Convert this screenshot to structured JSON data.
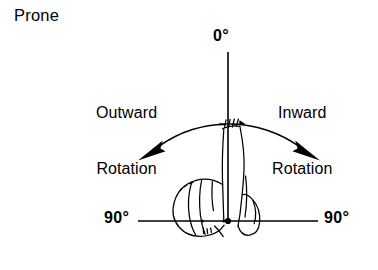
{
  "figure": {
    "title": "Prone",
    "ink_color": "#000000",
    "background_color": "#ffffff"
  },
  "labels": {
    "zero_degrees": "0°",
    "outward_line1": "Outward",
    "outward_line2": "Rotation",
    "inward_line1": "Inward",
    "inward_line2": "Rotation",
    "ninety_left": "90°",
    "ninety_right": "90°"
  },
  "geometry": {
    "pivot_x": 228,
    "pivot_y": 221,
    "vertical_axis_top_y": 52,
    "baseline_left_x": 138,
    "baseline_right_x": 318,
    "arc_left_end_x": 137,
    "arc_left_end_y": 152,
    "arc_right_end_x": 320,
    "arc_right_end_y": 152,
    "arc_apex_y": 122
  },
  "icons": {
    "pivot": "pivot-dot-icon",
    "arrow_left": "arrow-outward-rotation-icon",
    "arrow_right": "arrow-inward-rotation-icon",
    "limb": "prone-leg-illustration-icon"
  }
}
